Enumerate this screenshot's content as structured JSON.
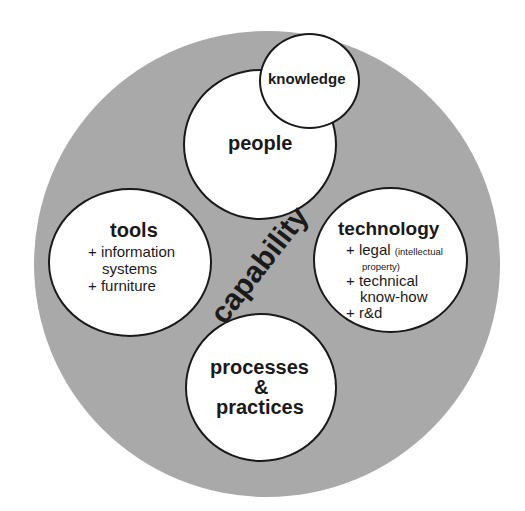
{
  "diagram": {
    "colors": {
      "outer_fill": "#a9a9a9",
      "node_fill": "#ffffff",
      "stroke": "#1a1a1a",
      "text": "#1a1a1a"
    },
    "center_label": "capability",
    "nodes": {
      "knowledge": {
        "title": "knowledge"
      },
      "people": {
        "title": "people"
      },
      "tools": {
        "title": "tools",
        "items": [
          "+ information",
          "systems",
          "+ furniture"
        ]
      },
      "technology": {
        "title": "technology",
        "items": {
          "legal": "+ legal",
          "legal_note_1": "(intellectual",
          "legal_note_2": "property)",
          "technical_1": "+ technical",
          "technical_2": "know-how",
          "rd": "+ r&d"
        }
      },
      "processes": {
        "title_line1": "processes",
        "title_line2": "&",
        "title_line3": "practices"
      }
    }
  }
}
